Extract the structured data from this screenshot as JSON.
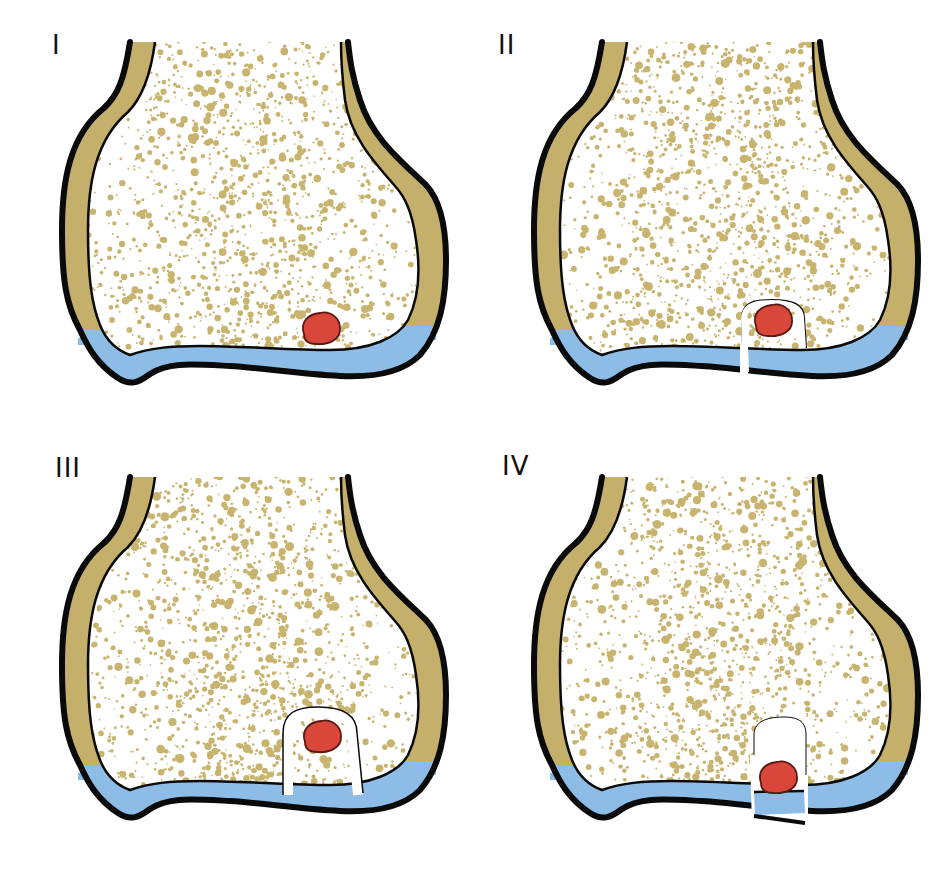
{
  "figure": {
    "panels": [
      {
        "label": "I",
        "stage": 1,
        "incision": "none"
      },
      {
        "label": "II",
        "stage": 2,
        "incision": "partial"
      },
      {
        "label": "III",
        "stage": 3,
        "incision": "complete"
      },
      {
        "label": "IV",
        "stage": 4,
        "incision": "displaced"
      }
    ],
    "colors": {
      "cortex": "#c4b06a",
      "cancellous_dots": "#c8b46e",
      "cartilage": "#8dbde6",
      "lesion": "#d9473a",
      "lesion_outline": "#5a1a14",
      "outline": "#0a0a0a",
      "background": "#ffffff"
    }
  }
}
